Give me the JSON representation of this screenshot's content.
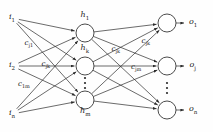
{
  "diagram": {
    "type": "neural-network",
    "layers": {
      "input": {
        "name": "input-layer",
        "nodes": [
          {
            "id": "i1",
            "base": "i",
            "sub": "1",
            "x": 12,
            "y": 18
          },
          {
            "id": "i2",
            "base": "i",
            "sub": "2",
            "x": 12,
            "y": 66
          },
          {
            "id": "in",
            "base": "i",
            "sub": "n",
            "x": 12,
            "y": 114
          }
        ]
      },
      "hidden": {
        "name": "hidden-layer",
        "nodes": [
          {
            "id": "h1",
            "base": "h",
            "sub": "1",
            "x": 85,
            "y": 33,
            "r": 9,
            "label_y": 16
          },
          {
            "id": "hk",
            "base": "h",
            "sub": "k",
            "x": 85,
            "y": 66,
            "r": 9,
            "label_y": 49
          },
          {
            "id": "hm",
            "base": "h",
            "sub": "m",
            "x": 85,
            "y": 100,
            "r": 9,
            "label_y": 112
          }
        ],
        "ellipsis": {
          "x": 85,
          "y": 83
        }
      },
      "output": {
        "name": "output-layer",
        "nodes": [
          {
            "id": "o1",
            "base": "o",
            "sub": "1",
            "x": 167,
            "y": 23,
            "r": 9,
            "label_x": 193,
            "label_y": 23
          },
          {
            "id": "oj",
            "base": "o",
            "sub": "j",
            "x": 167,
            "y": 66,
            "r": 9,
            "label_x": 193,
            "label_y": 66
          },
          {
            "id": "on",
            "base": "o",
            "sub": "n",
            "x": 167,
            "y": 110,
            "r": 9,
            "label_x": 193,
            "label_y": 110
          }
        ],
        "ellipsis": {
          "x": 167,
          "y": 88
        }
      }
    },
    "weight_labels": [
      {
        "id": "w-cj1",
        "base": "c",
        "sub": "j1",
        "x": 29,
        "y": 44
      },
      {
        "id": "w-cjk-left",
        "base": "c",
        "sub": "jk",
        "x": 46,
        "y": 65
      },
      {
        "id": "w-c1m",
        "base": "c",
        "sub": "1m",
        "x": 24,
        "y": 85
      },
      {
        "id": "w-cjk-mid",
        "base": "c",
        "sub": "jk",
        "x": 116,
        "y": 50
      },
      {
        "id": "w-cjk-right",
        "base": "c",
        "sub": "jk",
        "x": 146,
        "y": 42
      },
      {
        "id": "w-cjm",
        "base": "c",
        "sub": "jm",
        "x": 136,
        "y": 68
      }
    ],
    "style": {
      "line_color": "#2b2b2b",
      "node_stroke": "#2b2b2b",
      "node_fill": "#ffffff",
      "text_color": "#1a1a1a",
      "background": "#fefefe",
      "line_width": 0.7,
      "node_radius": 9
    }
  }
}
